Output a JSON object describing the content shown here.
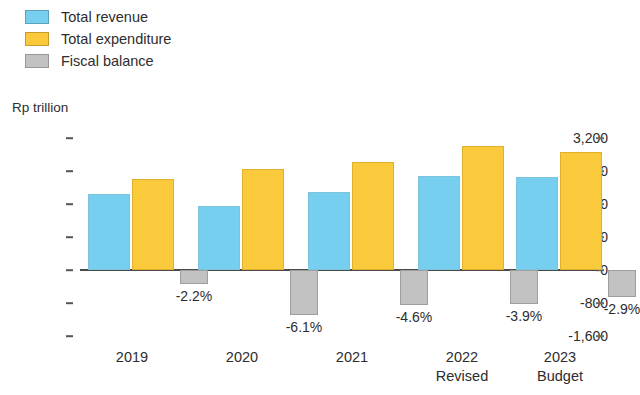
{
  "chart_data": {
    "type": "bar",
    "title": "",
    "subtitle": "",
    "xlabel": "",
    "ylabel": "Rp trillion",
    "ylim": [
      -1600,
      3200
    ],
    "ytick_values": [
      3200,
      2400,
      1600,
      800,
      0,
      -800,
      -1600
    ],
    "ytick_labels": [
      "3,200",
      "2,400",
      "1,600",
      "800",
      "0",
      "-800",
      "-1,600"
    ],
    "grid": false,
    "legend_position": "top-left",
    "categories": [
      "2019",
      "2020",
      "2021",
      "2022 Revised",
      "2023 Budget"
    ],
    "category_labels": [
      {
        "line1": "2019",
        "line2": ""
      },
      {
        "line1": "2020",
        "line2": ""
      },
      {
        "line1": "2021",
        "line2": ""
      },
      {
        "line1": "2022",
        "line2": "Revised"
      },
      {
        "line1": "2023",
        "line2": "Budget"
      }
    ],
    "series": [
      {
        "name": "Total revenue",
        "color": "#77cff0",
        "values": [
          1850,
          1550,
          1900,
          2280,
          2250
        ]
      },
      {
        "name": "Total expenditure",
        "color": "#fbca3c",
        "values": [
          2200,
          2450,
          2620,
          3010,
          2850
        ]
      },
      {
        "name": "Fiscal balance",
        "color": "#c2c2c2",
        "values": [
          -350,
          -1100,
          -850,
          -830,
          -660
        ]
      }
    ],
    "annotations": {
      "fiscal_balance_pct": [
        "-2.2%",
        "-6.1%",
        "-4.6%",
        "-3.9%",
        "-2.9%"
      ]
    }
  },
  "legend": {
    "items": [
      {
        "label": "Total revenue",
        "color": "#77cff0"
      },
      {
        "label": "Total expenditure",
        "color": "#fbca3c"
      },
      {
        "label": "Fiscal balance",
        "color": "#c2c2c2"
      }
    ]
  },
  "axis": {
    "unit_label": "Rp trillion"
  }
}
